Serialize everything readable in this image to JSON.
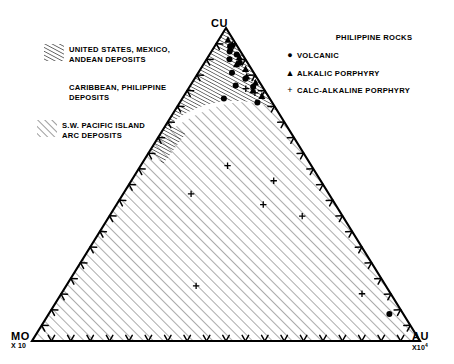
{
  "figure": {
    "type": "ternary-diagram",
    "apexes": {
      "top": {
        "label": "CU",
        "sub": ""
      },
      "left": {
        "label": "MO",
        "sub": "X 10",
        "sup": ""
      },
      "right": {
        "label": "AU",
        "sub": "X10",
        "sup": "4"
      }
    }
  },
  "legend_fields": {
    "items": [
      {
        "hatch": "steep-dense",
        "label": "UNITED STATES, MEXICO,\nANDEAN DEPOSITS"
      },
      {
        "hatch": "none",
        "label": "CARIBBEAN, PHILIPPINE\nDEPOSITS"
      },
      {
        "hatch": "diagonal-open",
        "label": "S.W. PACIFIC ISLAND\nARC DEPOSITS"
      }
    ]
  },
  "legend_symbols": {
    "title": "PHILIPPINE ROCKS",
    "items": [
      {
        "symbol": "filled-circle",
        "glyph": "●",
        "label": "VOLCANIC"
      },
      {
        "symbol": "filled-triangle",
        "glyph": "▲",
        "label": "ALKALIC PORPHYRY"
      },
      {
        "symbol": "plus",
        "glyph": "+",
        "label": "CALC-ALKALINE PORPHYRY"
      }
    ]
  },
  "colors": {
    "ink": "#000000",
    "background": "#ffffff",
    "hatch": "#555555"
  },
  "chart_data": {
    "type": "scatter",
    "title": "",
    "xlabel": "",
    "ylabel": "",
    "ternary": true,
    "axes": [
      "CU",
      "MO",
      "AU"
    ],
    "axis_scales": {
      "CU": "1",
      "MO": "x10",
      "AU": "x10^4"
    },
    "ticks_per_edge": 20,
    "grid": false,
    "legend_position": "top-right",
    "series": [
      {
        "name": "VOLCANIC",
        "marker": "filled-circle",
        "points": [
          [
            0.941,
            0.019,
            0.04
          ],
          [
            0.925,
            0.028,
            0.047
          ],
          [
            0.915,
            0.015,
            0.07
          ],
          [
            0.9,
            0.041,
            0.059
          ],
          [
            0.889,
            0.02,
            0.091
          ],
          [
            0.857,
            0.056,
            0.087
          ],
          [
            0.838,
            0.031,
            0.131
          ],
          [
            0.816,
            0.067,
            0.117
          ],
          [
            0.812,
            0.024,
            0.164
          ],
          [
            0.775,
            0.118,
            0.107
          ],
          [
            0.762,
            0.038,
            0.2
          ],
          [
            0.086,
            0.036,
            0.878
          ]
        ]
      },
      {
        "name": "ALKALIC PORPHYRY",
        "marker": "filled-triangle",
        "points": [
          [
            0.962,
            0.014,
            0.024
          ],
          [
            0.948,
            0.01,
            0.042
          ],
          [
            0.934,
            0.022,
            0.044
          ],
          [
            0.907,
            0.012,
            0.081
          ],
          [
            0.884,
            0.031,
            0.085
          ],
          [
            0.869,
            0.015,
            0.116
          ],
          [
            0.845,
            0.024,
            0.131
          ],
          [
            0.826,
            0.011,
            0.163
          ],
          [
            0.801,
            0.03,
            0.169
          ],
          [
            0.783,
            0.016,
            0.201
          ]
        ]
      },
      {
        "name": "CALC-ALKALINE PORPHYRY",
        "marker": "plus",
        "points": [
          [
            0.806,
            0.046,
            0.148
          ],
          [
            0.793,
            0.029,
            0.178
          ],
          [
            0.56,
            0.216,
            0.224
          ],
          [
            0.512,
            0.121,
            0.367
          ],
          [
            0.47,
            0.355,
            0.175
          ],
          [
            0.436,
            0.186,
            0.378
          ],
          [
            0.399,
            0.104,
            0.497
          ],
          [
            0.176,
            0.489,
            0.335
          ],
          [
            0.151,
            0.074,
            0.775
          ]
        ]
      }
    ]
  }
}
